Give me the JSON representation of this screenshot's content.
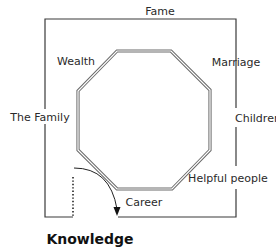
{
  "diagram": {
    "type": "bagua-map",
    "colors": {
      "line": "#3a3a3a",
      "octagon_outer": "#6a6a6a",
      "octagon_inner": "#ffffff",
      "text": "#2a2a2a",
      "background": "#ffffff"
    },
    "areas": {
      "fame": "Fame",
      "wealth": "Wealth",
      "marriage": "Marriage",
      "the_family": "The Family",
      "children": "Children",
      "helpful_people": "Helpful people",
      "career": "Career",
      "knowledge": "Knowledge"
    },
    "entrance": {
      "dotted_line": "door",
      "arrow": "curved-arrow"
    }
  }
}
